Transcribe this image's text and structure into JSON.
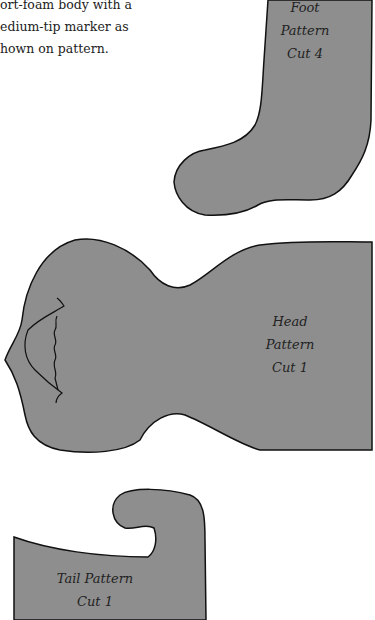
{
  "instructions": {
    "lines": [
      "ort-foam body with a",
      "edium-tip marker as",
      "hown on pattern."
    ]
  },
  "patterns": {
    "foot": {
      "line1": "Foot",
      "line2": "Pattern",
      "line3": "Cut 4"
    },
    "head": {
      "line1": "Head",
      "line2": "Pattern",
      "line3": "Cut 1"
    },
    "tail": {
      "line1": "Tail Pattern",
      "line2": "Cut 1"
    }
  },
  "colors": {
    "fill": "#8e8e8e",
    "stroke": "#111111",
    "background": "#ffffff"
  }
}
